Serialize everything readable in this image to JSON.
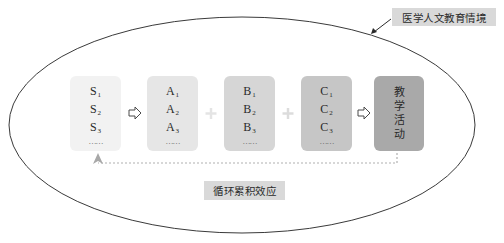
{
  "diagram": {
    "context_label": "医学人文教育情境",
    "feedback_label": "循环累积效应",
    "columns": [
      {
        "id": "S",
        "items": [
          {
            "base": "S",
            "sub": "1"
          },
          {
            "base": "S",
            "sub": "2"
          },
          {
            "base": "S",
            "sub": "3"
          }
        ],
        "ellipsis": "……",
        "color": "#f2f2f2"
      },
      {
        "id": "A",
        "items": [
          {
            "base": "A",
            "sub": "1"
          },
          {
            "base": "A",
            "sub": "2"
          },
          {
            "base": "A",
            "sub": "3"
          }
        ],
        "ellipsis": "……",
        "color": "#e6e6e6"
      },
      {
        "id": "B",
        "items": [
          {
            "base": "B",
            "sub": "1"
          },
          {
            "base": "B",
            "sub": "2"
          },
          {
            "base": "B",
            "sub": "3"
          }
        ],
        "ellipsis": "……",
        "color": "#d6d6d6"
      },
      {
        "id": "C",
        "items": [
          {
            "base": "C",
            "sub": "1"
          },
          {
            "base": "C",
            "sub": "2"
          },
          {
            "base": "C",
            "sub": "3"
          }
        ],
        "ellipsis": "……",
        "color": "#c6c6c6"
      }
    ],
    "activity": {
      "chars": [
        "教",
        "学",
        "活",
        "动"
      ],
      "color": "#a9a9a9"
    },
    "operators": {
      "s_to_a": "arrow-right",
      "a_plus_b": "+",
      "b_plus_c": "+",
      "c_to_activity": "arrow-right"
    },
    "colors": {
      "ellipse_stroke": "#3a3a3a",
      "label_bg": "#d9d9d9",
      "dashed_feedback": "#b0b0b0",
      "plus_sign": "#e4e4e4"
    }
  }
}
